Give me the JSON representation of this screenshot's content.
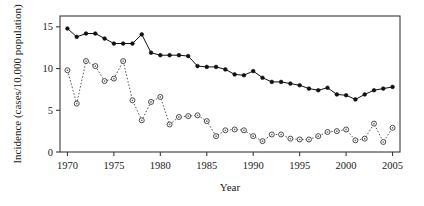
{
  "chart_data": {
    "type": "line",
    "title": "",
    "xlabel": "Year",
    "ylabel": "Incidence (cases/10,000 population)",
    "xlim": [
      1969.2,
      2005.8
    ],
    "ylim": [
      0,
      16.3
    ],
    "grid": false,
    "legend": "none",
    "xticks": [
      1970,
      1975,
      1980,
      1985,
      1990,
      1995,
      2000,
      2005
    ],
    "xtick_labels": [
      "1970",
      "1975",
      "1980",
      "1985",
      "1990",
      "1995",
      "2000",
      "2005"
    ],
    "yticks": [
      0,
      5,
      10,
      15
    ],
    "ytick_labels": [
      "0",
      "5",
      "10",
      "15"
    ],
    "x": [
      1970,
      1971,
      1972,
      1973,
      1974,
      1975,
      1976,
      1977,
      1978,
      1979,
      1980,
      1981,
      1982,
      1983,
      1984,
      1985,
      1986,
      1987,
      1988,
      1989,
      1990,
      1991,
      1992,
      1993,
      1994,
      1995,
      1996,
      1997,
      1998,
      1999,
      2000,
      2001,
      2002,
      2003,
      2004,
      2005
    ],
    "series": [
      {
        "name": "solid-filled-circle-series",
        "marker": "filled-circle",
        "linestyle": "solid",
        "color": "#111111",
        "values": [
          14.8,
          13.8,
          14.2,
          14.2,
          13.6,
          13.0,
          13.0,
          13.0,
          14.1,
          11.9,
          11.6,
          11.6,
          11.6,
          11.5,
          10.3,
          10.2,
          10.2,
          9.9,
          9.3,
          9.2,
          9.7,
          8.9,
          8.4,
          8.4,
          8.2,
          8.0,
          7.6,
          7.4,
          7.7,
          6.9,
          6.8,
          6.3,
          6.9,
          7.4,
          7.6,
          7.8
        ]
      },
      {
        "name": "open-circle-series",
        "marker": "open-circle",
        "linestyle": "dotted",
        "color": "#5a5a5a",
        "values": [
          9.8,
          5.8,
          10.9,
          10.3,
          8.5,
          8.8,
          10.9,
          6.2,
          3.8,
          6.0,
          6.6,
          3.3,
          4.2,
          4.3,
          4.4,
          3.7,
          1.9,
          2.6,
          2.7,
          2.6,
          1.9,
          1.3,
          2.1,
          2.1,
          1.6,
          1.5,
          1.5,
          1.9,
          2.4,
          2.5,
          2.7,
          1.4,
          1.6,
          3.4,
          1.2,
          2.9
        ]
      }
    ]
  },
  "geometry": {
    "plot_left": 60,
    "plot_right": 400,
    "plot_top": 16,
    "plot_bottom": 152
  }
}
